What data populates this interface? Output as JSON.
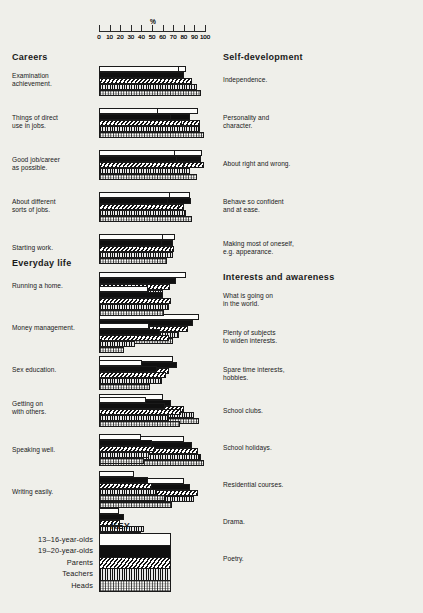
{
  "axis": {
    "title": "%",
    "ticks": [
      0,
      10,
      20,
      30,
      40,
      50,
      60,
      70,
      80,
      90,
      100
    ],
    "tick_labels": [
      "0",
      "10",
      "20",
      "30",
      "40",
      "50",
      "60",
      "70",
      "80",
      "90",
      "100"
    ],
    "min": 0,
    "max": 100
  },
  "key": {
    "title": "KEY",
    "series": [
      {
        "name": "13–16-year-olds",
        "fill": "white"
      },
      {
        "name": "19–20-year-olds",
        "fill": "black"
      },
      {
        "name": "Parents",
        "fill": "diagonal-hatch"
      },
      {
        "name": "Teachers",
        "fill": "vertical-lines"
      },
      {
        "name": "Heads",
        "fill": "stipple"
      }
    ]
  },
  "sections": [
    {
      "id": "careers",
      "title": "Careers",
      "column": "left",
      "groups": [
        {
          "label": "Examination\nachievement.",
          "values": [
            82,
            79,
            86,
            32,
            19
          ]
        },
        {
          "label": "Things of direct\nuse in jobs.",
          "values": [
            93,
            86,
            95,
            25,
            14
          ]
        },
        {
          "label": "Good job/career\nas possible.",
          "values": [
            97,
            96,
            99,
            50,
            33
          ]
        },
        {
          "label": "About different\nsorts of jobs.",
          "values": [
            86,
            87,
            80,
            61,
            56
          ]
        },
        {
          "label": "Starting work.",
          "values": [
            72,
            70,
            71,
            56,
            44
          ]
        }
      ]
    },
    {
      "id": "everyday-life",
      "title": "Everyday life",
      "column": "left",
      "groups": [
        {
          "label": "Running a home.",
          "values": [
            82,
            73,
            67,
            60,
            53
          ]
        },
        {
          "label": "Money management.",
          "values": [
            94,
            89,
            84,
            75,
            70
          ]
        },
        {
          "label": "Sex education.",
          "values": [
            70,
            74,
            66,
            49,
            43
          ]
        },
        {
          "label": "Getting on\nwith others.",
          "values": [
            60,
            68,
            80,
            90,
            94
          ]
        },
        {
          "label": "Speaking well.",
          "values": [
            80,
            88,
            93,
            96,
            99
          ]
        },
        {
          "label": "Writing easily.",
          "values": [
            80,
            86,
            93,
            90,
            69
          ]
        }
      ]
    },
    {
      "id": "self-development",
      "title": "Self-development",
      "column": "right",
      "groups": [
        {
          "label": "Independence.",
          "values": [
            75,
            80,
            88,
            92,
            96
          ]
        },
        {
          "label": "Personality and\ncharacter.",
          "values": [
            56,
            68,
            78,
            95,
            99
          ]
        },
        {
          "label": "About right and wrong.",
          "values": [
            72,
            74,
            80,
            86,
            92
          ]
        },
        {
          "label": "Behave so confident\nand at ease.",
          "values": [
            67,
            65,
            75,
            82,
            88
          ]
        },
        {
          "label": "Making most of oneself,\ne.g. appearance.",
          "values": [
            60,
            59,
            68,
            70,
            64
          ]
        }
      ]
    },
    {
      "id": "interests-and-awareness",
      "title": "Interests and awareness",
      "column": "right",
      "groups": [
        {
          "label": "What is going on\nin the world.",
          "values": [
            46,
            60,
            68,
            66,
            61
          ]
        },
        {
          "label": "Plenty of subjects\nto widen interests.",
          "values": [
            47,
            58,
            66,
            34,
            24
          ]
        },
        {
          "label": "Spare time interests,\nhobbies.",
          "values": [
            41,
            55,
            63,
            59,
            48
          ]
        },
        {
          "label": "School clubs.",
          "values": [
            44,
            62,
            77,
            66,
            76
          ]
        },
        {
          "label": "School holidays.",
          "values": [
            40,
            50,
            53,
            47,
            42
          ]
        },
        {
          "label": "Residential courses.",
          "values": [
            33,
            46,
            50,
            55,
            62
          ]
        },
        {
          "label": "Drama.",
          "values": [
            19,
            24,
            20,
            42,
            40
          ]
        },
        {
          "label": "Poetry.",
          "values": [
            7,
            12,
            15,
            26,
            29
          ]
        }
      ]
    }
  ],
  "chart_data": {
    "type": "bar",
    "title": "",
    "xlabel": "%",
    "ylabel": "",
    "xlim": [
      0,
      100
    ],
    "grid": false,
    "orientation": "horizontal",
    "legend_position": "bottom-left",
    "series": [
      {
        "name": "13–16-year-olds",
        "fill": "white"
      },
      {
        "name": "19–20-year-olds",
        "fill": "black"
      },
      {
        "name": "Parents",
        "fill": "diagonal-hatch"
      },
      {
        "name": "Teachers",
        "fill": "vertical-lines"
      },
      {
        "name": "Heads",
        "fill": "stipple"
      }
    ],
    "categories": [
      "Examination achievement.",
      "Things of direct use in jobs.",
      "Good job/career as possible.",
      "About different sorts of jobs.",
      "Starting work.",
      "Running a home.",
      "Money management.",
      "Sex education.",
      "Getting on with others.",
      "Speaking well.",
      "Writing easily.",
      "Independence.",
      "Personality and character.",
      "About right and wrong.",
      "Behave so confident and at ease.",
      "Making most of oneself, e.g. appearance.",
      "What is going on in the world.",
      "Plenty of subjects to widen interests.",
      "Spare time interests, hobbies.",
      "School clubs.",
      "School holidays.",
      "Residential courses.",
      "Drama.",
      "Poetry."
    ],
    "values": [
      [
        82,
        79,
        86,
        32,
        19
      ],
      [
        93,
        86,
        95,
        25,
        14
      ],
      [
        97,
        96,
        99,
        50,
        33
      ],
      [
        86,
        87,
        80,
        61,
        56
      ],
      [
        72,
        70,
        71,
        56,
        44
      ],
      [
        82,
        73,
        67,
        60,
        53
      ],
      [
        94,
        89,
        84,
        75,
        70
      ],
      [
        70,
        74,
        66,
        49,
        43
      ],
      [
        60,
        68,
        80,
        90,
        94
      ],
      [
        80,
        88,
        93,
        96,
        99
      ],
      [
        80,
        86,
        93,
        90,
        69
      ],
      [
        75,
        80,
        88,
        92,
        96
      ],
      [
        56,
        68,
        78,
        95,
        99
      ],
      [
        72,
        74,
        80,
        86,
        92
      ],
      [
        67,
        65,
        75,
        82,
        88
      ],
      [
        60,
        59,
        68,
        70,
        64
      ],
      [
        46,
        60,
        68,
        66,
        61
      ],
      [
        47,
        58,
        66,
        34,
        24
      ],
      [
        41,
        55,
        63,
        59,
        48
      ],
      [
        44,
        62,
        77,
        66,
        76
      ],
      [
        40,
        50,
        53,
        47,
        42
      ],
      [
        33,
        46,
        50,
        55,
        62
      ],
      [
        19,
        24,
        20,
        42,
        40
      ],
      [
        7,
        12,
        15,
        26,
        29
      ]
    ]
  }
}
